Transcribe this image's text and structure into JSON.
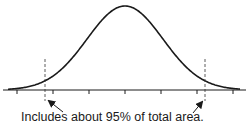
{
  "diagram": {
    "type": "normal-distribution-curve",
    "caption": "Includes about 95% of total area.",
    "colors": {
      "curve": "#1a1a1a",
      "axis": "#1a1a1a",
      "dashed": "#333333",
      "text": "#1a1a1a"
    },
    "axis": {
      "tick_count": 7
    },
    "shaded_interval": {
      "coverage_percent": 95
    }
  },
  "chart_data": {
    "type": "line",
    "title": "",
    "xlabel": "",
    "ylabel": "",
    "series": [
      {
        "name": "normal density curve",
        "shape": "bell"
      }
    ],
    "ticks": [
      "-3σ",
      "-2σ",
      "-1σ",
      "μ",
      "+1σ",
      "+2σ",
      "+3σ"
    ],
    "markers": [
      {
        "name": "left bound",
        "style": "dashed",
        "approx": "-1.96σ"
      },
      {
        "name": "right bound",
        "style": "dashed",
        "approx": "+1.96σ"
      }
    ],
    "annotations": [
      "Includes about 95% of total area."
    ],
    "grid": false,
    "legend": "none"
  }
}
